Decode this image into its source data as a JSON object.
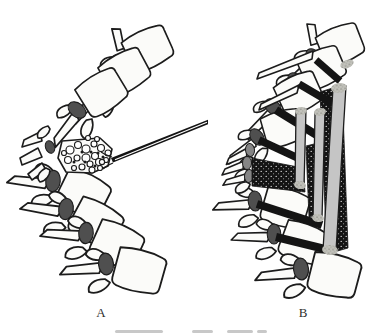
{
  "figure_labels": {
    "panel_a": "A",
    "panel_b": "B"
  },
  "colors": {
    "background": "#ffffff",
    "outline": "#1c1c1c",
    "bone_fill": "#fbfbf9",
    "pedicle_dark": "#4f4f4f",
    "pedicle_gray": "#858585",
    "implant_black": "#141414",
    "strut_gray": "#c5c5c5",
    "label_color": "#2e2e2e",
    "caption_fragment": "#c8c8c8"
  },
  "caption_fragment": {
    "y": 330,
    "height": 3,
    "dashes": [
      [
        115,
        48
      ],
      [
        192,
        21
      ],
      [
        227,
        26
      ],
      [
        257,
        10
      ]
    ]
  },
  "figure": {
    "panel_a": {
      "vertebrae": [
        {
          "x": 121,
          "y": 63,
          "rot": -27,
          "s": 1.05,
          "top": true
        },
        {
          "x": 99,
          "y": 88,
          "rot": -31,
          "s": 1.05
        },
        {
          "x": 77,
          "y": 110,
          "rot": -34,
          "s": 1.05
        },
        {
          "x": 53,
          "y": 181,
          "rot": 24,
          "s": 1.12
        },
        {
          "x": 66,
          "y": 209,
          "rot": 26,
          "s": 1.12
        },
        {
          "x": 86,
          "y": 233,
          "rot": 22,
          "s": 1.12
        },
        {
          "x": 106,
          "y": 264,
          "rot": 13,
          "s": 1.15
        }
      ],
      "collapsed_pedicle": {
        "x": 50,
        "y": 147,
        "rx": 4.5,
        "ry": 6.5,
        "rot": -20
      },
      "pebbles": [
        [
          70,
          150,
          4
        ],
        [
          78,
          145,
          3.5
        ],
        [
          86,
          149,
          4
        ],
        [
          94,
          144,
          3
        ],
        [
          101,
          148,
          3.5
        ],
        [
          108,
          153,
          3
        ],
        [
          95,
          156,
          3.5
        ],
        [
          86,
          158,
          4
        ],
        [
          77,
          158,
          3
        ],
        [
          68,
          160,
          3.5
        ],
        [
          90,
          164,
          3
        ],
        [
          99,
          162,
          3.5
        ],
        [
          106,
          160,
          2.5
        ],
        [
          82,
          167,
          3
        ],
        [
          92,
          170,
          3
        ],
        [
          100,
          168,
          2.5
        ],
        [
          74,
          168,
          2.5
        ],
        [
          88,
          138,
          2.5
        ],
        [
          97,
          139,
          2.5
        ],
        [
          64,
          153,
          2.5
        ]
      ],
      "dark_bits": [
        [
          82,
          152
        ],
        [
          91,
          152
        ],
        [
          98,
          153
        ],
        [
          85,
          162
        ],
        [
          95,
          166
        ],
        [
          74,
          162
        ],
        [
          103,
          157
        ]
      ],
      "needle": {
        "tail": [
          208,
          122
        ],
        "tip": [
          111,
          160
        ],
        "half_width": 2.2
      }
    },
    "panel_b": {
      "vertebrae": [
        {
          "x": 314,
          "y": 57,
          "rot": -24,
          "s": 1.0,
          "top": true
        },
        {
          "x": 296,
          "y": 81,
          "rot": -26,
          "s": 1.0
        },
        {
          "x": 273,
          "y": 107,
          "rot": -27,
          "s": 1.0
        },
        {
          "x": 257,
          "y": 137,
          "rot": -18,
          "s": 0.95
        },
        {
          "x": 255,
          "y": 201,
          "rot": 14,
          "s": 1.05
        },
        {
          "x": 274,
          "y": 234,
          "rot": 18,
          "s": 1.05
        },
        {
          "x": 301,
          "y": 269,
          "rot": 12,
          "s": 1.15,
          "ped_small": false
        }
      ],
      "small_units": [
        {
          "x": 250,
          "y": 150,
          "rot": -6
        },
        {
          "x": 247,
          "y": 163,
          "rot": 0
        },
        {
          "x": 249,
          "y": 176,
          "rot": 6
        }
      ],
      "long_spikes": [
        [
          [
            313,
            51
          ],
          [
            259,
            73
          ],
          [
            257,
            79
          ],
          [
            312,
            59
          ]
        ],
        [
          [
            299,
            85
          ],
          [
            261,
            104
          ],
          [
            259,
            110
          ],
          [
            297,
            93
          ]
        ]
      ],
      "dark_regions": [
        [
          [
            320,
            92
          ],
          [
            342,
            85
          ],
          [
            348,
            248
          ],
          [
            327,
            254
          ]
        ],
        [
          [
            306,
            146
          ],
          [
            318,
            143
          ],
          [
            320,
            214
          ],
          [
            309,
            217
          ]
        ],
        [
          [
            252,
            158
          ],
          [
            303,
            168
          ],
          [
            305,
            192
          ],
          [
            252,
            186
          ]
        ]
      ],
      "bars": [
        [
          316,
          60,
          340,
          81,
          7
        ],
        [
          299,
          84,
          333,
          104,
          7.5
        ],
        [
          276,
          110,
          323,
          139,
          8
        ],
        [
          259,
          140,
          300,
          159,
          7.5
        ],
        [
          257,
          204,
          322,
          225,
          8
        ],
        [
          276,
          237,
          333,
          251,
          8
        ]
      ],
      "struts": [
        [
          [
            296,
            111
          ],
          [
            306,
            109
          ],
          [
            304,
            186
          ],
          [
            295,
            187
          ]
        ],
        [
          [
            315,
            113
          ],
          [
            325,
            110
          ],
          [
            322,
            218
          ],
          [
            313,
            220
          ]
        ],
        [
          [
            333,
            88
          ],
          [
            346,
            86
          ],
          [
            336,
            251
          ],
          [
            323,
            250
          ]
        ]
      ],
      "tips": [
        [
          301,
          111,
          6,
          4,
          -8
        ],
        [
          300,
          185,
          6,
          4,
          8
        ],
        [
          320,
          112,
          6,
          4,
          -8
        ],
        [
          318,
          218,
          6,
          4,
          8
        ],
        [
          339,
          88,
          8,
          5,
          -8
        ],
        [
          330,
          250,
          8,
          5,
          8
        ],
        [
          347,
          64,
          7,
          4,
          -22
        ]
      ]
    }
  }
}
